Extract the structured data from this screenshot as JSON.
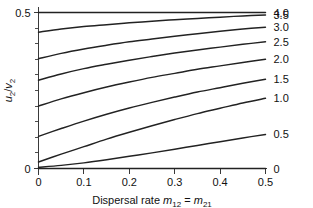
{
  "chart_data": {
    "type": "line",
    "title": "",
    "subtitle": "",
    "xlabel": "Dispersal rate m12 = m21",
    "xlabel_parts": {
      "prefix": "Dispersal rate ",
      "sym1": "m",
      "sub1": "12",
      "eq": " = ",
      "sym2": "m",
      "sub2": "21"
    },
    "ylabel": "u2/v2",
    "ylabel_parts": {
      "sym1": "u",
      "sub1": "2",
      "slash": "/",
      "sym2": "v",
      "sub2": "2"
    },
    "xlim": [
      0,
      0.5
    ],
    "ylim": [
      0,
      0.5
    ],
    "grid": false,
    "legend_position": "right-of-axes-curve-end-labels",
    "xticks": [
      0,
      0.1,
      0.2,
      0.3,
      0.4,
      0.5
    ],
    "xticklabels": [
      "0",
      "0.1",
      "0.2",
      "0.3",
      "0.4",
      "0.5"
    ],
    "yticks": [
      0,
      0.05,
      0.1,
      0.15,
      0.2,
      0.25,
      0.3,
      0.35,
      0.4,
      0.45,
      0.5
    ],
    "yticklabels": [
      "0",
      "",
      "",
      "",
      "",
      "",
      "",
      "",
      "",
      "",
      "0.5"
    ],
    "x": [
      0,
      0.05,
      0.1,
      0.15,
      0.2,
      0.25,
      0.3,
      0.35,
      0.4,
      0.45,
      0.5
    ],
    "series": [
      {
        "name": "4.0",
        "label": "4.0",
        "values": [
          0.5,
          0.5,
          0.5,
          0.5,
          0.5,
          0.5,
          0.5,
          0.5,
          0.5,
          0.5,
          0.5
        ]
      },
      {
        "name": "3.5",
        "label": "3.5",
        "values": [
          0.437,
          0.447,
          0.455,
          0.461,
          0.467,
          0.472,
          0.477,
          0.481,
          0.485,
          0.489,
          0.492
        ]
      },
      {
        "name": "3.0",
        "label": "3.0",
        "values": [
          0.352,
          0.369,
          0.383,
          0.395,
          0.406,
          0.415,
          0.424,
          0.432,
          0.44,
          0.447,
          0.453
        ]
      },
      {
        "name": "2.5",
        "label": "2.5",
        "values": [
          0.283,
          0.303,
          0.32,
          0.334,
          0.347,
          0.359,
          0.37,
          0.38,
          0.389,
          0.398,
          0.406
        ]
      },
      {
        "name": "2.0",
        "label": "2.0",
        "values": [
          0.2,
          0.223,
          0.243,
          0.261,
          0.277,
          0.292,
          0.305,
          0.318,
          0.329,
          0.34,
          0.35
        ]
      },
      {
        "name": "1.5",
        "label": "1.5",
        "values": [
          0.103,
          0.128,
          0.152,
          0.174,
          0.194,
          0.212,
          0.229,
          0.245,
          0.259,
          0.273,
          0.286
        ]
      },
      {
        "name": "1.0",
        "label": "1.0",
        "values": [
          0.021,
          0.046,
          0.07,
          0.094,
          0.116,
          0.137,
          0.157,
          0.176,
          0.193,
          0.21,
          0.225
        ]
      },
      {
        "name": "0.5",
        "label": "0.5",
        "values": [
          0.004,
          0.01,
          0.018,
          0.028,
          0.039,
          0.05,
          0.062,
          0.074,
          0.086,
          0.098,
          0.109
        ]
      },
      {
        "name": "0",
        "label": "0",
        "values": [
          0,
          0,
          0,
          0,
          0,
          0,
          0,
          0,
          0,
          0,
          0
        ]
      }
    ],
    "curve_end_labels": [
      "4.0",
      "3.5",
      "3.0",
      "2.5",
      "2.0",
      "1.5",
      "1.0",
      "0.5",
      "0"
    ],
    "colors": {
      "line": "#222222",
      "axis": "#3a3a3a",
      "text": "#111111",
      "background": "#ffffff"
    }
  }
}
